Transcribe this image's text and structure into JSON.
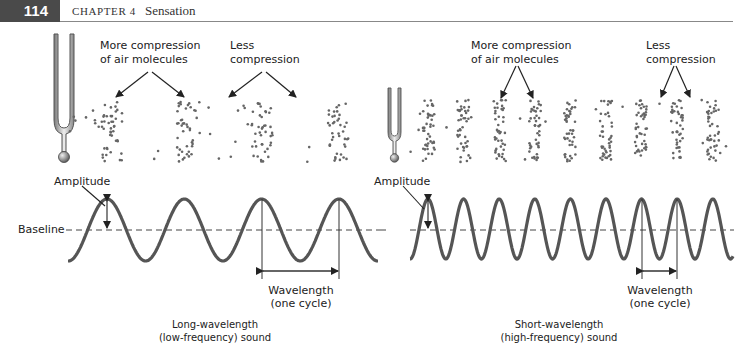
{
  "header": {
    "page_number": "114",
    "chapter_label": "CHAPTER 4",
    "chapter_title": "Sensation"
  },
  "left_panel": {
    "compression_label_line1": "More compression",
    "compression_label_line2": "of air molecules",
    "less_label_line1": "Less",
    "less_label_line2": "compression",
    "amplitude_label": "Amplitude",
    "baseline_label": "Baseline",
    "wavelength_label_line1": "Wavelength",
    "wavelength_label_line2": "(one cycle)",
    "caption_line1": "Long-wavelength",
    "caption_line2": "(low-frequency) sound",
    "cycles": 4
  },
  "right_panel": {
    "compression_label_line1": "More compression",
    "compression_label_line2": "of air molecules",
    "less_label_line1": "Less",
    "less_label_line2": "compression",
    "amplitude_label": "Amplitude",
    "wavelength_label_line1": "Wavelength",
    "wavelength_label_line2": "(one cycle)",
    "caption_line1": "Short-wavelength",
    "caption_line2": "(high-frequency) sound",
    "cycles": 9
  },
  "colors": {
    "header_bar": "#4a4a4a",
    "wave": "#555555",
    "dots": "#666666"
  }
}
